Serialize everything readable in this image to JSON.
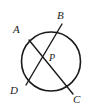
{
  "figure": {
    "background_color": "#ffffff",
    "stroke_color": "#1a1a1a",
    "label_color": "#1a1a1a",
    "labels": {
      "A": "A",
      "B": "B",
      "C": "C",
      "D": "D",
      "P": "P"
    },
    "circle": {
      "center_x": 51,
      "center_y": 61.5,
      "radius": 29.5,
      "stroke_width": 1.6
    },
    "points": {
      "A": {
        "x": 29,
        "y": 40
      },
      "B": {
        "x": 62,
        "y": 24
      },
      "C": {
        "x": 73,
        "y": 94
      },
      "D": {
        "x": 26,
        "y": 85
      },
      "P": {
        "x": 44.5,
        "y": 57.5
      }
    },
    "chords": [
      {
        "name": "chord-AC",
        "from": "A",
        "to": "C",
        "stroke_width": 1.4
      },
      {
        "name": "chord-BD",
        "from": "B",
        "to": "D",
        "stroke_width": 1.4
      }
    ]
  }
}
